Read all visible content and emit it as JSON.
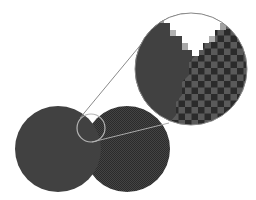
{
  "diagram": {
    "title": "Magnified view of dithered pixel pattern at the junction of two circles",
    "colors": {
      "background": "#ffffff",
      "solid_fill": "#414141",
      "checker_dark": "#2b2b2b",
      "checker_light": "#5a5a5a",
      "outline": "#8a8a8a",
      "notch": "#ffffff"
    },
    "shapes": {
      "left_circle": {
        "cx": 58,
        "cy": 149,
        "r": 43,
        "fill": "solid"
      },
      "right_circle": {
        "cx": 127,
        "cy": 149,
        "r": 43,
        "fill": "checkerboard"
      },
      "loupe_circle": {
        "cx": 91,
        "cy": 128,
        "r": 14
      },
      "magnified_circle": {
        "cx": 191,
        "cy": 69,
        "r": 56
      },
      "connector_lines": [
        {
          "x1": 80,
          "y1": 118,
          "x2": 143,
          "y2": 42
        },
        {
          "x1": 92,
          "y1": 142,
          "x2": 169,
          "y2": 123
        }
      ]
    },
    "labels": []
  }
}
